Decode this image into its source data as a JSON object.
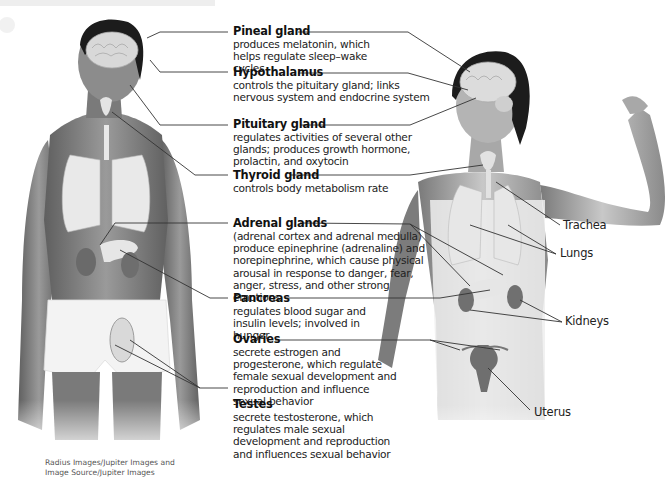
{
  "figure": {
    "title": "Endocrine system",
    "male_figure": "male-torso-with-endocrine-organs",
    "female_figure": "female-torso-with-endocrine-organs"
  },
  "glands": [
    {
      "name": "Pineal gland",
      "description": "produces melatonin, which helps regulate sleep–wake cycles"
    },
    {
      "name": "Hypothalamus",
      "description": "controls the pituitary gland; links nervous system and endocrine system"
    },
    {
      "name": "Pituitary gland",
      "description": "regulates activities of several other glands; produces growth hormone, prolactin, and oxytocin"
    },
    {
      "name": "Thyroid gland",
      "description": "controls body metabolism rate"
    },
    {
      "name": "Adrenal glands",
      "description": "(adrenal cortex and adrenal medulla) produce epinephrine (adrenaline) and norepinephrine, which cause physical arousal in response to danger, fear, anger, stress, and other strong emotions"
    },
    {
      "name": "Pancreas",
      "description": "regulates blood sugar and insulin levels; involved in hunger"
    },
    {
      "name": "Ovaries",
      "description": "secrete estrogen and progesterone, which regulate female sexual development and reproduction and influence sexual behavior"
    },
    {
      "name": "Testes",
      "description": "secrete testosterone, which regulates male sexual development and reproduction and influences sexual behavior"
    }
  ],
  "side_labels": [
    "Trachea",
    "Lungs",
    "Kidneys",
    "Uterus"
  ],
  "credit": {
    "line1": "Radius Images/Jupiter Images and",
    "line2": "Image Source/Jupiter Images"
  },
  "colors": {
    "skin": "#8a8a8a",
    "organ": "#e6e6e6",
    "hair": "#1c1c1c",
    "line": "#333333"
  }
}
